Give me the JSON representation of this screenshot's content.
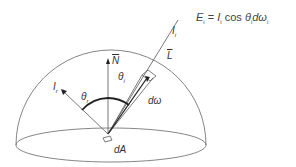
{
  "equation": {
    "lhs": "E",
    "lhs_sub": "i",
    "equals": "=",
    "term1": "I",
    "term1_sub": "i",
    "cos": "cos",
    "theta": "θ",
    "theta_sub": "i",
    "d_omega": "dω",
    "d_omega_sub": "i"
  },
  "labels": {
    "incident_intensity": "I",
    "incident_intensity_sub": "i",
    "light_vector": "L",
    "normal_vector": "N",
    "reflected_intensity": "I",
    "reflected_intensity_sub": "r",
    "theta_incident": "θ",
    "theta_incident_sub": "i",
    "theta_reflected": "θ",
    "theta_reflected_sub": "r",
    "solid_angle": "dω",
    "area_element": "dA"
  },
  "colors": {
    "line": "#555555",
    "arc": "#222222",
    "text": "#333333"
  }
}
